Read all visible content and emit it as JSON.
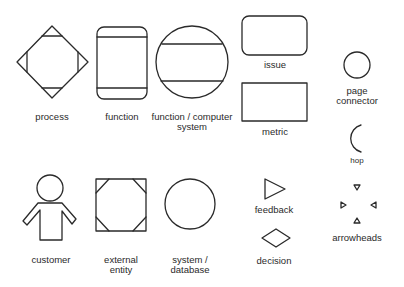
{
  "diagram": {
    "title": "",
    "stroke_color": "#2a2a2a",
    "background": "#ffffff",
    "symbols": [
      {
        "id": "process",
        "shape": "diamond-with-corner-triangles",
        "label_lines": [
          "process"
        ]
      },
      {
        "id": "function",
        "shape": "rounded-rect-with-bands",
        "label_lines": [
          "function"
        ]
      },
      {
        "id": "function-computer-system",
        "shape": "circle-with-bands",
        "label_lines": [
          "function / computer",
          "system"
        ]
      },
      {
        "id": "issue",
        "shape": "rounded-rect",
        "label_lines": [
          "issue"
        ]
      },
      {
        "id": "metric",
        "shape": "rect",
        "label_lines": [
          "metric"
        ]
      },
      {
        "id": "page-connector",
        "shape": "small-circle",
        "label_lines": [
          "page",
          "connector"
        ]
      },
      {
        "id": "hop",
        "shape": "arc",
        "label_lines": [
          "hop"
        ]
      },
      {
        "id": "customer",
        "shape": "person",
        "label_lines": [
          "customer"
        ]
      },
      {
        "id": "external-entity",
        "shape": "square-with-corner-cuts",
        "label_lines": [
          "external",
          "entity"
        ]
      },
      {
        "id": "system-database",
        "shape": "circle",
        "label_lines": [
          "system /",
          "database"
        ]
      },
      {
        "id": "feedback",
        "shape": "triangle-right",
        "label_lines": [
          "feedback"
        ]
      },
      {
        "id": "decision",
        "shape": "diamond",
        "label_lines": [
          "decision"
        ]
      },
      {
        "id": "arrowheads",
        "shape": "four-arrowheads",
        "label_lines": [
          "arrowheads"
        ]
      }
    ]
  }
}
